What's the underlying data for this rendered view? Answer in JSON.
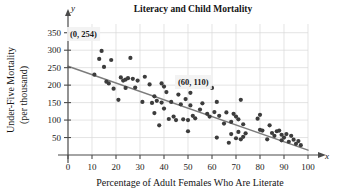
{
  "chart_data": {
    "type": "scatter",
    "title": "Literacy and Child Mortality",
    "xlabel": "Percentage of Adult Females Who Are Literate",
    "ylabel": "Under-Five Mortality (per thousand)",
    "ylabel_line1": "Under-Five Mortality",
    "ylabel_line2": "(per thousand)",
    "x_axis_name": "x",
    "y_axis_name": "y",
    "xlim": [
      0,
      100
    ],
    "ylim": [
      0,
      375
    ],
    "xticks": [
      0,
      10,
      20,
      30,
      40,
      50,
      60,
      70,
      80,
      90,
      100
    ],
    "yticks": [
      50,
      100,
      150,
      200,
      250,
      300,
      350
    ],
    "grid": true,
    "legend": "none",
    "annotations": [
      {
        "label": "(0, 254)",
        "x": 0,
        "y": 254
      },
      {
        "label": "(60, 110)",
        "x": 60,
        "y": 110
      }
    ],
    "trendline": {
      "name": "least-squares regression line",
      "point1": {
        "x": 0,
        "y": 254
      },
      "point2": {
        "x": 60,
        "y": 110
      },
      "slope": -2.4,
      "intercept": 254,
      "x_start": 0,
      "x_end": 100,
      "y_start": 254,
      "y_end": 14
    },
    "points": [
      [
        11,
        230
      ],
      [
        13,
        275
      ],
      [
        14,
        298
      ],
      [
        15,
        252
      ],
      [
        16,
        210
      ],
      [
        17,
        205
      ],
      [
        18,
        272
      ],
      [
        19,
        190
      ],
      [
        21,
        158
      ],
      [
        22,
        222
      ],
      [
        23,
        213
      ],
      [
        24,
        192
      ],
      [
        24,
        216
      ],
      [
        25,
        220
      ],
      [
        26,
        278
      ],
      [
        27,
        218
      ],
      [
        28,
        193
      ],
      [
        29,
        213
      ],
      [
        31,
        152
      ],
      [
        32,
        224
      ],
      [
        34,
        202
      ],
      [
        35,
        149
      ],
      [
        36,
        168
      ],
      [
        36,
        120
      ],
      [
        37,
        155
      ],
      [
        38,
        85
      ],
      [
        39,
        205
      ],
      [
        39,
        150
      ],
      [
        40,
        196
      ],
      [
        40,
        133
      ],
      [
        41,
        180
      ],
      [
        42,
        103
      ],
      [
        43,
        152
      ],
      [
        44,
        110
      ],
      [
        45,
        100
      ],
      [
        46,
        173
      ],
      [
        47,
        145
      ],
      [
        48,
        102
      ],
      [
        49,
        160
      ],
      [
        50,
        100
      ],
      [
        50,
        68
      ],
      [
        51,
        178
      ],
      [
        51,
        142
      ],
      [
        52,
        112
      ],
      [
        53,
        105
      ],
      [
        55,
        130
      ],
      [
        56,
        148
      ],
      [
        58,
        118
      ],
      [
        59,
        110
      ],
      [
        60,
        192
      ],
      [
        61,
        123
      ],
      [
        62,
        50
      ],
      [
        62,
        152
      ],
      [
        63,
        112
      ],
      [
        65,
        90
      ],
      [
        66,
        122
      ],
      [
        67,
        35
      ],
      [
        68,
        60
      ],
      [
        68,
        95
      ],
      [
        69,
        118
      ],
      [
        70,
        48
      ],
      [
        70,
        110
      ],
      [
        71,
        66
      ],
      [
        71,
        102
      ],
      [
        72,
        45
      ],
      [
        72,
        158
      ],
      [
        73,
        52
      ],
      [
        73,
        88
      ],
      [
        74,
        62
      ],
      [
        79,
        104
      ],
      [
        80,
        115
      ],
      [
        80,
        72
      ],
      [
        81,
        70
      ],
      [
        83,
        45
      ],
      [
        84,
        85
      ],
      [
        85,
        63
      ],
      [
        86,
        55
      ],
      [
        87,
        68
      ],
      [
        88,
        70
      ],
      [
        89,
        42
      ],
      [
        89,
        58
      ],
      [
        90,
        50
      ],
      [
        91,
        60
      ],
      [
        92,
        38
      ],
      [
        93,
        55
      ],
      [
        94,
        44
      ],
      [
        95,
        32
      ],
      [
        96,
        40
      ],
      [
        97,
        28
      ]
    ]
  }
}
